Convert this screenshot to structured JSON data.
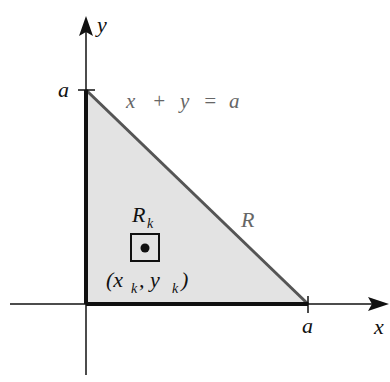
{
  "diagram": {
    "axes": {
      "x_label": "x",
      "y_label": "y"
    },
    "ticks": {
      "x_tick_label": "a",
      "y_tick_label": "a"
    },
    "line_equation": {
      "lhs_x": "x",
      "plus": "+",
      "lhs_y": "y",
      "equals": "=",
      "rhs": "a"
    },
    "region_label": "R",
    "subregion": {
      "label_main": "R",
      "label_sub": "k",
      "point_open": "(x",
      "point_sub1": "k",
      "point_comma": ", y",
      "point_sub2": "k",
      "point_close": ")"
    },
    "colors": {
      "fill": "#e3e3e3",
      "hypotenuse": "#555555",
      "axis": "#111111",
      "label_gray": "#666666"
    }
  }
}
